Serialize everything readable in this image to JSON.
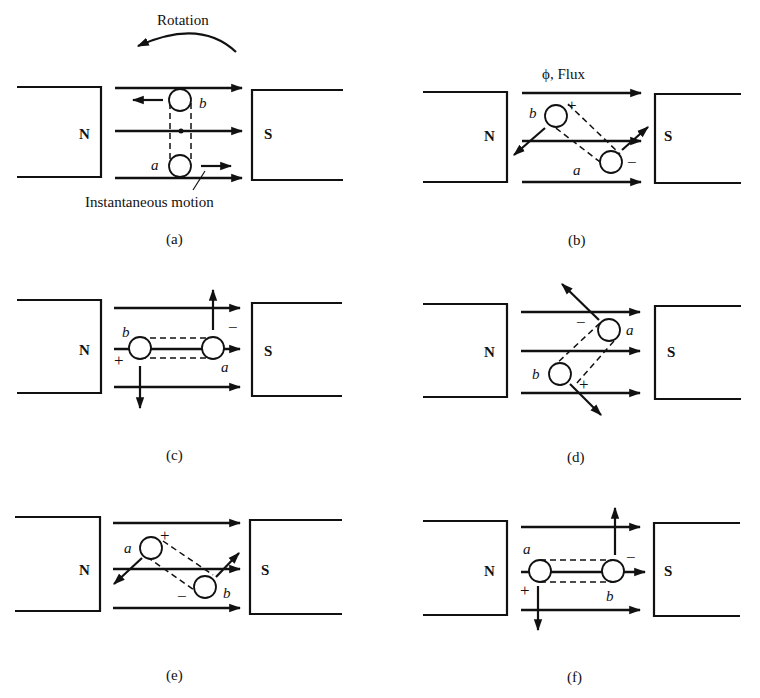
{
  "figure": {
    "rotation_label": "Rotation",
    "flux_label": "ϕ, Flux",
    "instantaneous_motion_label": "Instantaneous motion",
    "pole_north": "N",
    "pole_south": "S",
    "plus": "+",
    "minus": "−",
    "conductor_a": "a",
    "conductor_b": "b"
  },
  "panels": [
    {
      "id": "a",
      "caption": "(a)",
      "coil_orientation": "vertical",
      "top_conductor": "b",
      "bottom_conductor": "a",
      "motion": "b left, a right"
    },
    {
      "id": "b",
      "caption": "(b)",
      "coil_orientation": "diagonal-down-right",
      "top_conductor": "b",
      "top_sign": "+",
      "bottom_conductor": "a",
      "bottom_sign": "−"
    },
    {
      "id": "c",
      "caption": "(c)",
      "coil_orientation": "horizontal",
      "left_conductor": "b",
      "left_sign": "+",
      "right_conductor": "a",
      "right_sign": "−"
    },
    {
      "id": "d",
      "caption": "(d)",
      "coil_orientation": "diagonal-up-right",
      "top_conductor": "a",
      "top_sign": "−",
      "bottom_conductor": "b",
      "bottom_sign": "+"
    },
    {
      "id": "e",
      "caption": "(e)",
      "coil_orientation": "diagonal-down-right",
      "top_conductor": "a",
      "top_sign": "+",
      "bottom_conductor": "b",
      "bottom_sign": "−"
    },
    {
      "id": "f",
      "caption": "(f)",
      "coil_orientation": "horizontal",
      "left_conductor": "a",
      "left_sign": "+",
      "right_conductor": "b",
      "right_sign": "−"
    }
  ]
}
